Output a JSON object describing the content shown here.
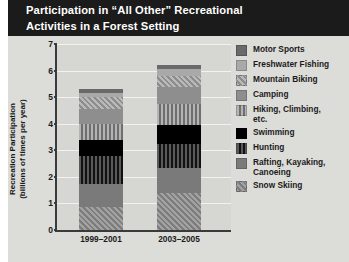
{
  "title": {
    "line1": "Participation in “All Other” Recreational",
    "line2": "Activities in a Forest Setting"
  },
  "colors": {
    "title_bg": "#1b1b1b",
    "title_fg": "#ffffff",
    "figure_bg": "#dcdcd8",
    "plot_bg": "#d6d6d2",
    "axis": "#3a3a3a",
    "gridline": "#f2f2f0"
  },
  "chart_data": {
    "type": "bar",
    "stacked": true,
    "title": "Participation in “All Other” Recreational Activities in a Forest Setting",
    "xlabel": "",
    "ylabel": "Recreation Participation (billions of times per year)",
    "ylabel_line1": "Recreation Participation",
    "ylabel_line2": "(billions of times per year)",
    "ylim": [
      0,
      7
    ],
    "yticks": [
      0,
      1,
      2,
      3,
      4,
      5,
      6,
      7
    ],
    "ytick_labels": [
      "0",
      "1",
      "2",
      "3",
      "4",
      "5",
      "6",
      "7"
    ],
    "grid": true,
    "legend_position": "right",
    "categories": [
      "1999–2001",
      "2003–2005"
    ],
    "totals": [
      5.3,
      6.2
    ],
    "series": [
      {
        "name": "Motor Sports",
        "values": [
          0.15,
          0.15
        ],
        "swatch": "solid-dark-gray",
        "color": "#6a6a6a"
      },
      {
        "name": "Freshwater Fishing",
        "values": [
          0.15,
          0.25
        ],
        "swatch": "solid-light-gray",
        "color": "#a8a8a8"
      },
      {
        "name": "Mountain Biking",
        "values": [
          0.45,
          0.4
        ],
        "swatch": "diagonal-hatch",
        "color": "#9a9a9a"
      },
      {
        "name": "Camping",
        "values": [
          0.55,
          0.65
        ],
        "swatch": "solid-mid-gray",
        "color": "#8e8e8e"
      },
      {
        "name": "Hiking, Climbing,\netc.",
        "values": [
          0.6,
          0.8
        ],
        "swatch": "vertical-stripe-light",
        "color": "#8a8a8a"
      },
      {
        "name": "Swimming",
        "values": [
          0.6,
          0.7
        ],
        "swatch": "solid-black",
        "color": "#000000"
      },
      {
        "name": "Hunting",
        "values": [
          1.05,
          0.9
        ],
        "swatch": "vertical-stripe-dark",
        "color": "#4a4a4a"
      },
      {
        "name": "Rafting, Kayaking,\nCanoeing",
        "values": [
          0.9,
          0.95
        ],
        "swatch": "solid-gray",
        "color": "#787878"
      },
      {
        "name": "Snow Skiing",
        "values": [
          0.85,
          1.4
        ],
        "swatch": "diagonal-hatch-dark",
        "color": "#8c8c8c"
      }
    ],
    "segment_bounds": {
      "1999–2001": [
        {
          "name": "Snow Skiing",
          "from": 0.0,
          "to": 0.85
        },
        {
          "name": "Rafting, Kayaking, Canoeing",
          "from": 0.85,
          "to": 1.75
        },
        {
          "name": "Hunting",
          "from": 1.75,
          "to": 2.8
        },
        {
          "name": "Swimming",
          "from": 2.8,
          "to": 3.4
        },
        {
          "name": "Hiking, Climbing, etc.",
          "from": 3.4,
          "to": 4.0
        },
        {
          "name": "Camping",
          "from": 4.0,
          "to": 4.55
        },
        {
          "name": "Mountain Biking",
          "from": 4.55,
          "to": 5.0
        },
        {
          "name": "Freshwater Fishing",
          "from": 5.0,
          "to": 5.15
        },
        {
          "name": "Motor Sports",
          "from": 5.15,
          "to": 5.3
        }
      ],
      "2003–2005": [
        {
          "name": "Snow Skiing",
          "from": 0.0,
          "to": 1.4
        },
        {
          "name": "Rafting, Kayaking, Canoeing",
          "from": 1.4,
          "to": 2.35
        },
        {
          "name": "Hunting",
          "from": 2.35,
          "to": 3.25
        },
        {
          "name": "Swimming",
          "from": 3.25,
          "to": 3.95
        },
        {
          "name": "Hiking, Climbing, etc.",
          "from": 3.95,
          "to": 4.75
        },
        {
          "name": "Camping",
          "from": 4.75,
          "to": 5.4
        },
        {
          "name": "Mountain Biking",
          "from": 5.4,
          "to": 5.8
        },
        {
          "name": "Freshwater Fishing",
          "from": 5.8,
          "to": 6.05
        },
        {
          "name": "Motor Sports",
          "from": 6.05,
          "to": 6.2
        }
      ]
    }
  }
}
